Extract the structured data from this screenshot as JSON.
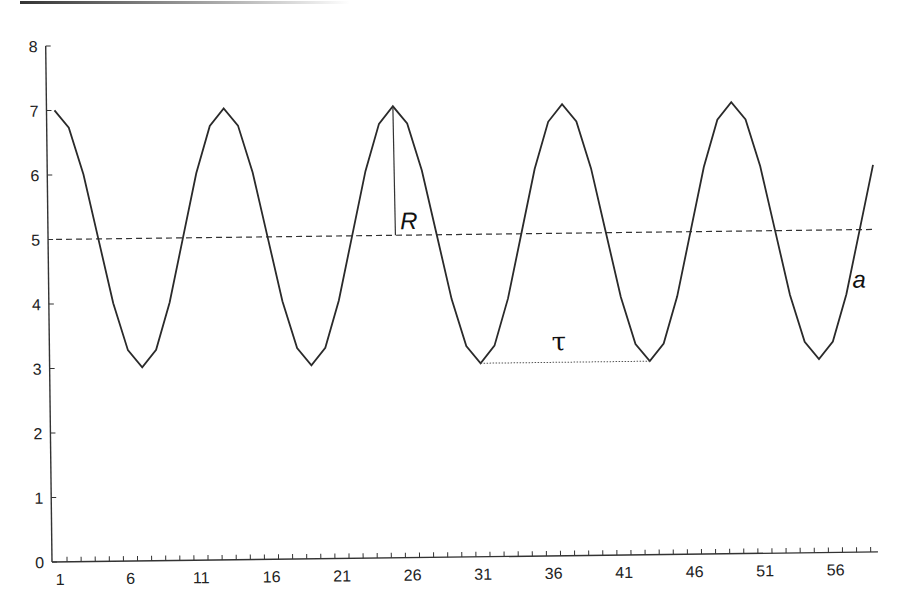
{
  "chart_data": {
    "type": "line",
    "title": "",
    "xlabel": "",
    "ylabel": "",
    "xlim": [
      1,
      59
    ],
    "ylim": [
      0,
      8
    ],
    "grid": false,
    "legend": null,
    "x_tick_labels": [
      "1",
      "6",
      "11",
      "16",
      "21",
      "26",
      "31",
      "36",
      "41",
      "46",
      "51",
      "56"
    ],
    "y_tick_labels": [
      "0",
      "1",
      "2",
      "3",
      "4",
      "5",
      "6",
      "7",
      "8"
    ],
    "x": [
      1,
      2,
      3,
      4,
      5,
      6,
      7,
      8,
      9,
      10,
      11,
      12,
      13,
      14,
      15,
      16,
      17,
      18,
      19,
      20,
      21,
      22,
      23,
      24,
      25,
      26,
      27,
      28,
      29,
      30,
      31,
      32,
      33,
      34,
      35,
      36,
      37,
      38,
      39,
      40,
      41,
      42,
      43,
      44,
      45,
      46,
      47,
      48,
      49,
      50,
      51,
      52,
      53,
      54,
      55,
      56,
      57,
      58,
      59
    ],
    "series": [
      {
        "name": "a",
        "style": "solid",
        "values": [
          7,
          6.73,
          6,
          5,
          4,
          3.27,
          3,
          3.27,
          4,
          5,
          6,
          6.73,
          7,
          6.73,
          6,
          5,
          4,
          3.27,
          3,
          3.27,
          4,
          5,
          6,
          6.73,
          7,
          6.73,
          6,
          5,
          4,
          3.27,
          3,
          3.27,
          4,
          5,
          6,
          6.73,
          7,
          6.73,
          6,
          5,
          4,
          3.27,
          3,
          3.27,
          4,
          5,
          6,
          6.73,
          7,
          6.73,
          6,
          5,
          4,
          3.27,
          3,
          3.27,
          4,
          5,
          6
        ]
      },
      {
        "name": "mean",
        "style": "dashed",
        "values_constant": 5
      }
    ],
    "annotations": [
      {
        "text": "R",
        "meaning": "amplitude: vertical line from mean (5) to peak (7) at x=25"
      },
      {
        "text": "τ",
        "meaning": "period: dotted line between troughs at x=31 and x=43"
      },
      {
        "text": "a",
        "meaning": "series label near x=58"
      }
    ]
  },
  "labels": {
    "R": "R",
    "tau": "τ",
    "a": "a"
  }
}
